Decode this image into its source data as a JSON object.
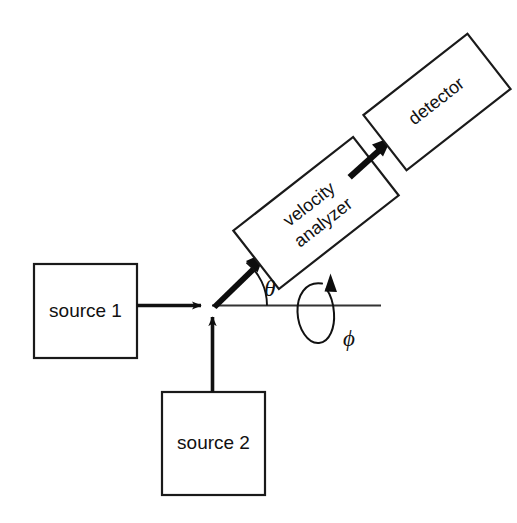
{
  "figure": {
    "background_color": "#ffffff",
    "line_color": "#111111",
    "width": 517,
    "height": 523
  },
  "boxes": [
    {
      "id": "source-1",
      "label": "source 1",
      "rotation_deg": 0,
      "x": 34,
      "y": 264,
      "w": 103,
      "h": 94
    },
    {
      "id": "source-2",
      "label": "source 2",
      "rotation_deg": 0,
      "x": 162,
      "y": 392,
      "w": 103,
      "h": 103
    },
    {
      "id": "velocity-analyzer",
      "label_line1": "velocity",
      "label_line2": "analyzer",
      "rotation_deg": -38,
      "cx": 316,
      "cy": 213,
      "w": 152,
      "h": 74
    },
    {
      "id": "detector",
      "label": "detector",
      "rotation_deg": -38,
      "cx": 437,
      "cy": 102,
      "w": 132,
      "h": 70
    }
  ],
  "beams": [
    {
      "id": "source1-beam",
      "from": "source 1",
      "to": "interaction region",
      "direction": "horizontal-right"
    },
    {
      "id": "source2-beam",
      "from": "source 2",
      "to": "interaction region",
      "direction": "vertical-up"
    },
    {
      "id": "scattered-beam",
      "from": "interaction region",
      "to": "velocity analyzer",
      "direction": "diagonal-up-right"
    },
    {
      "id": "analyzed-beam",
      "from": "velocity analyzer",
      "to": "detector",
      "direction": "diagonal-up-right"
    }
  ],
  "annotations": {
    "theta": {
      "symbol": "θ",
      "meaning": "scattering angle",
      "x": 270,
      "y": 291
    },
    "phi": {
      "symbol": "ϕ",
      "meaning": "azimuthal rotation angle",
      "x": 349,
      "y": 341
    },
    "axis": {
      "name": "beam axis",
      "x1": 212,
      "y1": 305,
      "x2": 381,
      "y2": 305
    },
    "rotation_loop": {
      "name": "phi-rotation-indicator",
      "cx": 316,
      "cy": 312
    }
  }
}
